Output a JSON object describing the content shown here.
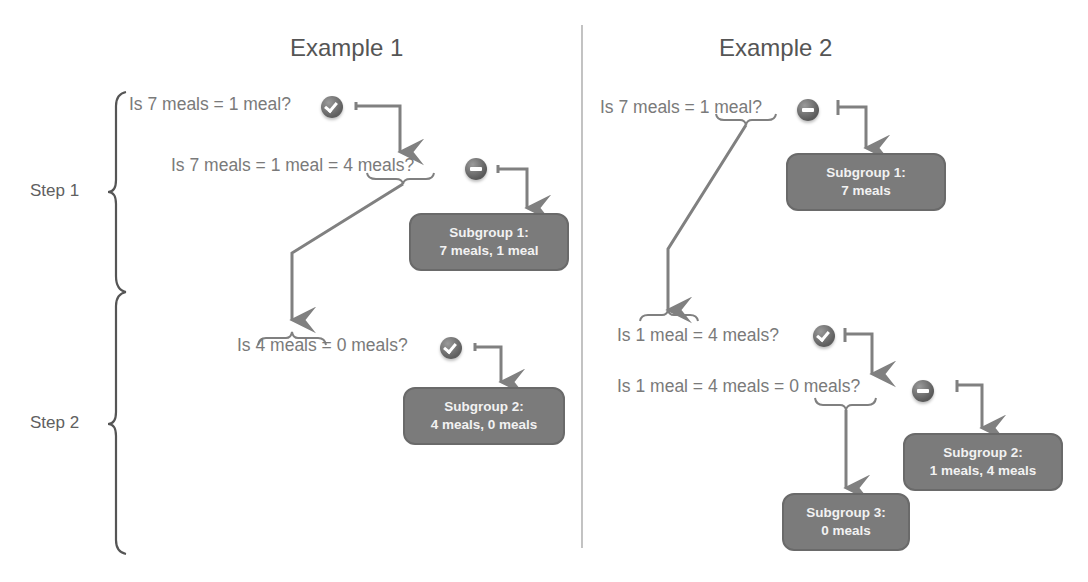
{
  "example1": {
    "title": "Example 1",
    "questions": [
      "Is 7 meals = 1 meal?",
      "Is 7 meals = 1 meal = 4 meals?",
      "Is 4 meals = 0 meals?"
    ],
    "answers": [
      "check",
      "minus",
      "check"
    ],
    "subgroups": [
      {
        "title": "Subgroup 1:",
        "contents": "7 meals, 1 meal"
      },
      {
        "title": "Subgroup 2:",
        "contents": "4 meals, 0 meals"
      }
    ]
  },
  "example2": {
    "title": "Example 2",
    "questions": [
      "Is 7 meals = 1 meal?",
      "Is 1 meal = 4 meals?",
      "Is 1 meal = 4 meals = 0 meals?"
    ],
    "answers": [
      "minus",
      "check",
      "minus"
    ],
    "subgroups": [
      {
        "title": "Subgroup 1:",
        "contents": "7 meals"
      },
      {
        "title": "Subgroup 2:",
        "contents": "1 meals, 4 meals"
      },
      {
        "title": "Subgroup 3:",
        "contents": "0 meals"
      }
    ]
  },
  "steps": [
    "Step 1",
    "Step 2"
  ],
  "colors": {
    "box_fill": "#7b7b7b",
    "box_text": "#f2f2f2",
    "arrow": "#808080",
    "text": "#7a7a7a"
  }
}
